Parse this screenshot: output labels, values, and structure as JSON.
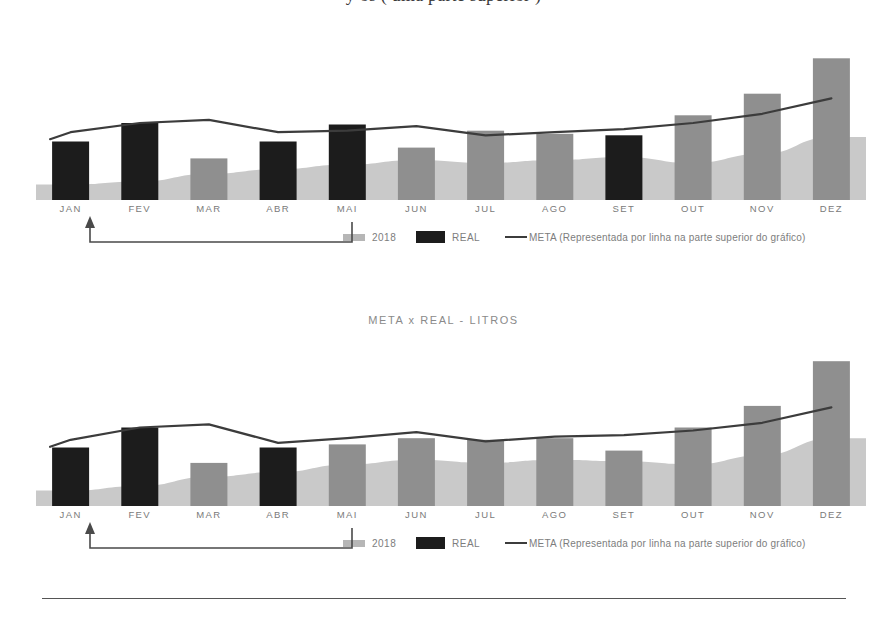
{
  "page": {
    "top_cropped_heading": "y  os  (   uma  parte  superior )",
    "section_title": "META x REAL - LITROS"
  },
  "legend": {
    "item_2018_label": "2018",
    "item_real_label": "REAL",
    "item_meta_label": "META (Representada por linha na parte superior do gráfico)",
    "swatch_2018_icon": "area-swatch-icon",
    "swatch_real_icon": "bar-swatch-icon",
    "swatch_meta_icon": "line-swatch-icon"
  },
  "colors": {
    "real_bar": "#1c1c1c",
    "goal_bar": "#8f8f8f",
    "area_2018": "#c9c9c9",
    "meta_line": "#3c3c3c",
    "axis_label": "#7a7a7a",
    "callout": "#4a4a4a"
  },
  "annotation": {
    "callout_target_month": "JAN",
    "callout_source": "2018"
  },
  "chart_data": [
    {
      "id": "chart-1",
      "type": "bar",
      "title": "",
      "xlabel": "",
      "ylabel": "",
      "ylim": [
        0,
        100
      ],
      "grid": false,
      "legend_position": "bottom",
      "categories": [
        "JAN",
        "FEV",
        "MAR",
        "ABR",
        "MAI",
        "JUN",
        "JUL",
        "AGO",
        "SET",
        "OUT",
        "NOV",
        "DEZ"
      ],
      "series": [
        {
          "name": "REAL",
          "kind": "bar",
          "values": [
            38,
            50,
            27,
            38,
            49,
            34,
            45,
            43,
            42,
            55,
            69,
            92
          ],
          "highlight": [
            true,
            true,
            false,
            true,
            true,
            false,
            false,
            false,
            true,
            false,
            false,
            false
          ]
        },
        {
          "name": "2018",
          "kind": "area",
          "values": [
            10,
            12,
            17,
            20,
            23,
            26,
            24,
            26,
            28,
            24,
            30,
            41
          ]
        },
        {
          "name": "META",
          "kind": "line",
          "values": [
            44,
            50,
            52,
            44,
            45,
            48,
            42,
            44,
            46,
            50,
            56,
            66
          ]
        }
      ]
    },
    {
      "id": "chart-2",
      "type": "bar",
      "title": "META x REAL - LITROS",
      "xlabel": "",
      "ylabel": "",
      "ylim": [
        0,
        100
      ],
      "grid": false,
      "legend_position": "bottom",
      "categories": [
        "JAN",
        "FEV",
        "MAR",
        "ABR",
        "MAI",
        "JUN",
        "JUL",
        "AGO",
        "SET",
        "OUT",
        "NOV",
        "DEZ"
      ],
      "series": [
        {
          "name": "REAL",
          "kind": "bar",
          "values": [
            38,
            51,
            28,
            38,
            40,
            44,
            43,
            44,
            36,
            51,
            65,
            94
          ],
          "highlight": [
            true,
            true,
            false,
            true,
            false,
            false,
            false,
            false,
            false,
            false,
            false,
            false
          ]
        },
        {
          "name": "2018",
          "kind": "area",
          "values": [
            10,
            13,
            19,
            22,
            27,
            30,
            28,
            30,
            29,
            27,
            33,
            44
          ]
        },
        {
          "name": "META",
          "kind": "line",
          "values": [
            43,
            51,
            53,
            41,
            44,
            48,
            42,
            45,
            46,
            49,
            54,
            64
          ]
        }
      ]
    }
  ]
}
